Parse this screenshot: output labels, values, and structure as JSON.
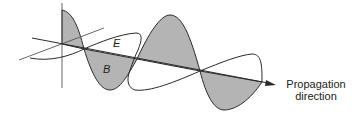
{
  "diagram": {
    "labels": {
      "electric_field": "E",
      "magnetic_field": "B",
      "direction_line1": "Propagation",
      "direction_line2": "direction"
    },
    "colors": {
      "stroke": "#2a2a2a",
      "fill_b": "#b4b4b4",
      "background": "#ffffff"
    }
  }
}
